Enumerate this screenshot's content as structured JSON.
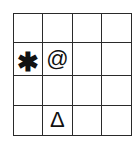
{
  "grid": {
    "rows": 4,
    "cols": 4,
    "cells": [
      [
        "",
        "",
        "",
        ""
      ],
      [
        "✱",
        "@",
        "",
        ""
      ],
      [
        "",
        "",
        "",
        ""
      ],
      [
        "",
        "Δ",
        "",
        ""
      ]
    ]
  },
  "symbols": [
    {
      "name": "asterisk",
      "glyph": "✱",
      "row": 2,
      "col": 1
    },
    {
      "name": "at-sign",
      "glyph": "@",
      "row": 2,
      "col": 2
    },
    {
      "name": "delta",
      "glyph": "Δ",
      "row": 4,
      "col": 2
    }
  ]
}
